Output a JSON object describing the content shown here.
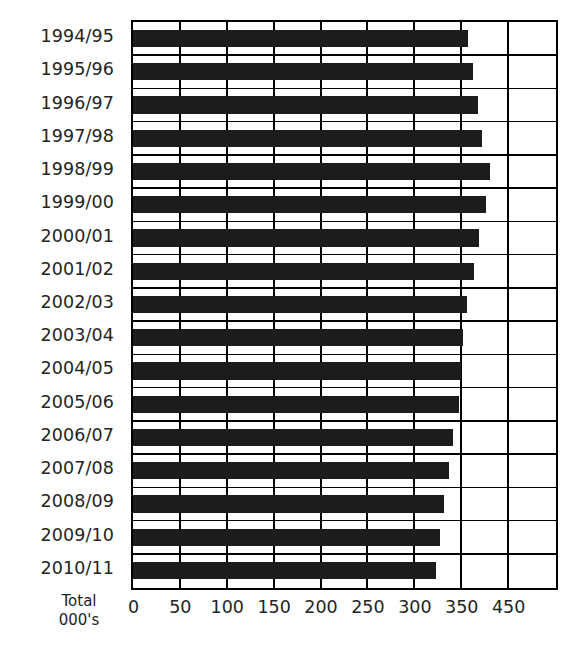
{
  "chart_data": {
    "type": "bar",
    "orientation": "horizontal",
    "title": "",
    "subtitle": "",
    "xlabel": "Total 000's",
    "ylabel": "",
    "xlim": [
      0,
      450
    ],
    "xticks": [
      0,
      50,
      100,
      150,
      200,
      250,
      300,
      350,
      450
    ],
    "xtick_labels": [
      "0",
      "50",
      "100",
      "150",
      "200",
      "250",
      "300",
      "350",
      "450"
    ],
    "grid": true,
    "grid_axis": "x",
    "legend": false,
    "legend_position": "none",
    "bar_color": "#1c1c1c",
    "categories": [
      "1994/95",
      "1995/96",
      "1996/97",
      "1997/98",
      "1998/99",
      "1999/00",
      "2000/01",
      "2001/02",
      "2002/03",
      "2003/04",
      "2004/05",
      "2005/06",
      "2006/07",
      "2007/08",
      "2008/09",
      "2009/10",
      "2010/11"
    ],
    "values": [
      357,
      363,
      368,
      372,
      381,
      376,
      369,
      364,
      356,
      352,
      350,
      348,
      341,
      337,
      332,
      327,
      323
    ]
  },
  "axis_caption": {
    "line1": "Total",
    "line2": "000's"
  }
}
